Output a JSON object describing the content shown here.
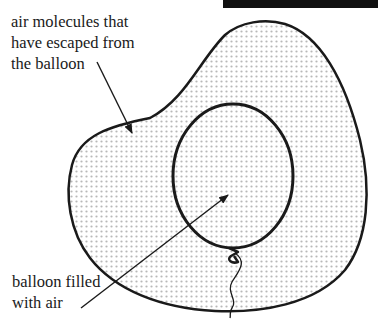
{
  "diagram": {
    "title": "",
    "labels": {
      "escaped_air": {
        "lines": [
          "air molecules that",
          "have escaped from",
          "the balloon"
        ]
      },
      "balloon": {
        "lines": [
          "balloon filled",
          "with air"
        ]
      }
    },
    "elements": {
      "outer_region": "air molecules region (dotted)",
      "balloon": "balloon",
      "knot": "balloon knot",
      "string": "balloon string"
    },
    "colors": {
      "stroke": "#1a1a1a",
      "fill_bg": "#ffffff",
      "dot": "#b8b8b8",
      "top_bar": "#111111"
    }
  }
}
